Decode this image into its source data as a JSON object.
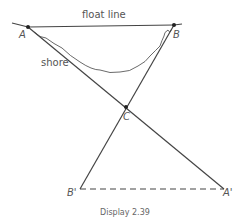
{
  "diagram": {
    "top_label": "float line",
    "shore_label": "shore",
    "points": {
      "A": "A",
      "B": "B",
      "C": "C",
      "Bp": "B'",
      "Ap": "A'"
    },
    "caption": "Display 2.39"
  }
}
